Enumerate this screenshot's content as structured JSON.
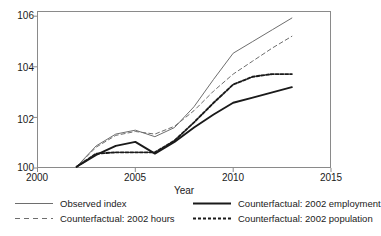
{
  "chart_data": {
    "type": "line",
    "title": "",
    "xlabel": "Year",
    "ylabel": "",
    "xlim": [
      2000,
      2015
    ],
    "ylim": [
      100,
      106
    ],
    "grid": false,
    "legend_position": "bottom",
    "xticks": [
      "2000",
      "2005",
      "2010",
      "2015"
    ],
    "yticks": [
      "100",
      "102",
      "104",
      "106"
    ],
    "x": [
      2002,
      2003,
      2004,
      2005,
      2006,
      2007,
      2008,
      2009,
      2010,
      2011,
      2012,
      2013
    ],
    "series": [
      {
        "name": "Observed index",
        "style": "solid-thin",
        "color": "#6e6e6e",
        "values": [
          100.05,
          100.85,
          101.3,
          101.45,
          101.2,
          101.55,
          102.35,
          103.4,
          104.4,
          104.85,
          105.3,
          105.75
        ]
      },
      {
        "name": "Counterfactual: 2002 hours",
        "style": "dashed",
        "color": "#6e6e6e",
        "values": [
          100.05,
          100.8,
          101.25,
          101.4,
          101.3,
          101.6,
          102.2,
          102.95,
          103.6,
          104.1,
          104.6,
          105.05
        ]
      },
      {
        "name": "Counterfactual: 2002 employment",
        "style": "solid-thick",
        "color": "#1a1a1a",
        "values": [
          100.05,
          100.5,
          100.85,
          101.0,
          100.55,
          101.0,
          101.55,
          102.05,
          102.5,
          102.7,
          102.9,
          103.1
        ]
      },
      {
        "name": "Counterfactual: 2002 population",
        "style": "dotted-thick",
        "color": "#1a1a1a",
        "values": [
          100.05,
          100.55,
          100.6,
          100.6,
          100.6,
          101.05,
          101.75,
          102.5,
          103.2,
          103.5,
          103.6,
          103.6
        ]
      }
    ]
  },
  "axes": {
    "xtitle": "Year",
    "ytick_labels": [
      "106",
      "104",
      "102",
      "100"
    ],
    "xtick_labels": [
      "2000",
      "2005",
      "2010",
      "2015"
    ]
  },
  "legend": {
    "rows": [
      [
        {
          "label": "Observed index",
          "key": "solid-thin-line-key"
        },
        {
          "label": "Counterfactual: 2002 employment",
          "key": "solid-thick-line-key"
        }
      ],
      [
        {
          "label": "Counterfactual: 2002 hours",
          "key": "dashed-line-key"
        },
        {
          "label": "Counterfactual: 2002 population",
          "key": "dotted-thick-line-key"
        }
      ]
    ]
  }
}
